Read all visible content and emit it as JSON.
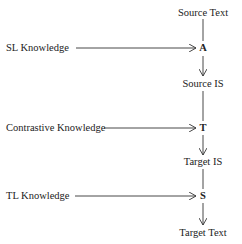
{
  "diagram": {
    "type": "flow",
    "chain": [
      {
        "id": "source_text",
        "label": "Source Text"
      },
      {
        "id": "A",
        "label": "A"
      },
      {
        "id": "source_is",
        "label": "Source IS"
      },
      {
        "id": "T",
        "label": "T"
      },
      {
        "id": "target_is",
        "label": "Target IS"
      },
      {
        "id": "S",
        "label": "S"
      },
      {
        "id": "target_text",
        "label": "Target Text"
      }
    ],
    "inputs": [
      {
        "label": "SL Knowledge",
        "target": "A"
      },
      {
        "label": "Contrastive Knowledge",
        "target": "T"
      },
      {
        "label": "TL Knowledge",
        "target": "S"
      }
    ],
    "colors": {
      "line": "#333333",
      "text": "#222222",
      "background": "#ffffff"
    }
  }
}
